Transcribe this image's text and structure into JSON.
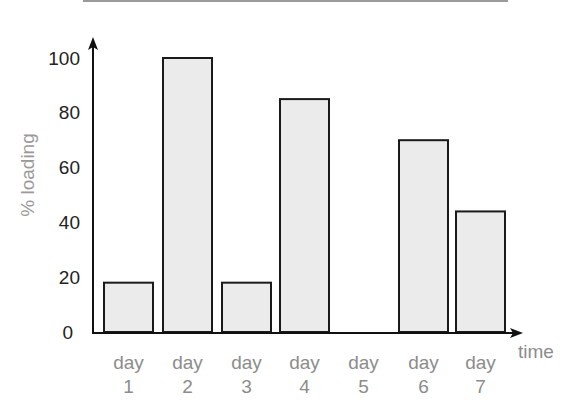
{
  "chart_data": {
    "type": "bar",
    "title": "",
    "xlabel": "time",
    "ylabel": "% loading",
    "categories": [
      {
        "line1": "day",
        "line2": "1"
      },
      {
        "line1": "day",
        "line2": "2"
      },
      {
        "line1": "day",
        "line2": "3"
      },
      {
        "line1": "day",
        "line2": "4"
      },
      {
        "line1": "day",
        "line2": "5"
      },
      {
        "line1": "day",
        "line2": "6"
      },
      {
        "line1": "day",
        "line2": "7"
      }
    ],
    "values": [
      18,
      100,
      18,
      85,
      0,
      70,
      44
    ],
    "yticks": [
      "0",
      "20",
      "40",
      "60",
      "80",
      "100"
    ],
    "ylim": [
      0,
      100
    ],
    "grid": false,
    "legend": null,
    "colors": {
      "bar_fill": "#ebebeb",
      "bar_stroke": "#1a1a1a",
      "axis": "#111111",
      "tick_text": "#222222",
      "label_text": "#8c8c8c"
    }
  }
}
